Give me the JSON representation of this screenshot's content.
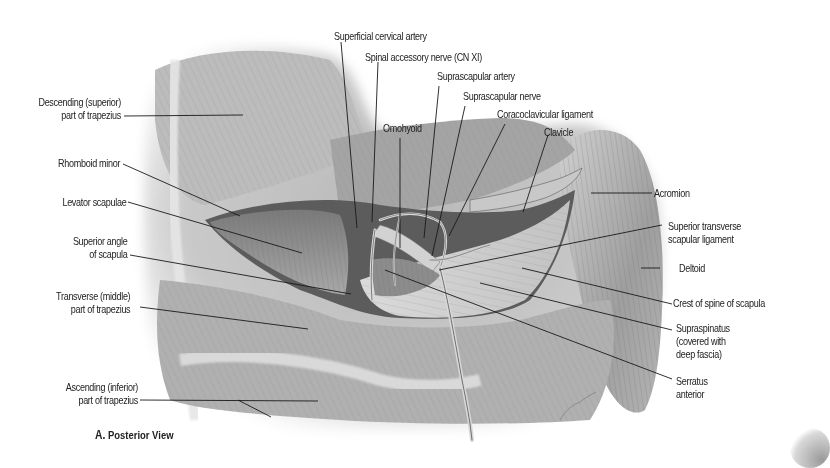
{
  "figure": {
    "caption_letter": "A.",
    "caption_text": "Posterior View",
    "background_color": "#ffffff",
    "illustration_tone": "#9a9a9a"
  },
  "labels": {
    "left": [
      {
        "id": "descending-trapezius",
        "lines": [
          "Descending (superior)",
          "part of trapezius"
        ]
      },
      {
        "id": "rhomboid-minor",
        "lines": [
          "Rhomboid minor"
        ]
      },
      {
        "id": "levator-scapulae",
        "lines": [
          "Levator scapulae"
        ]
      },
      {
        "id": "superior-angle-scapula",
        "lines": [
          "Superior angle",
          "of scapula"
        ]
      },
      {
        "id": "transverse-trapezius",
        "lines": [
          "Transverse (middle)",
          "part of trapezius"
        ]
      },
      {
        "id": "ascending-trapezius",
        "lines": [
          "Ascending (inferior)",
          "part of trapezius"
        ]
      }
    ],
    "top": [
      {
        "id": "superficial-cervical-artery",
        "lines": [
          "Superficial cervical artery"
        ]
      },
      {
        "id": "spinal-accessory-nerve",
        "lines": [
          "Spinal accessory nerve (CN XI)"
        ]
      },
      {
        "id": "suprascapular-artery",
        "lines": [
          "Suprascapular artery"
        ]
      },
      {
        "id": "suprascapular-nerve",
        "lines": [
          "Suprascapular nerve"
        ]
      },
      {
        "id": "omohyoid",
        "lines": [
          "Omohyoid"
        ]
      },
      {
        "id": "coracoclavicular-ligament",
        "lines": [
          "Coracoclavicular ligament"
        ]
      },
      {
        "id": "clavicle",
        "lines": [
          "Clavicle"
        ]
      }
    ],
    "right": [
      {
        "id": "acromion",
        "lines": [
          "Acromion"
        ]
      },
      {
        "id": "superior-transverse-scapular-ligament",
        "lines": [
          "Superior transverse",
          "scapular ligament"
        ]
      },
      {
        "id": "deltoid",
        "lines": [
          "Deltoid"
        ]
      },
      {
        "id": "crest-spine-scapula",
        "lines": [
          "Crest of spine of scapula"
        ]
      },
      {
        "id": "supraspinatus",
        "lines": [
          "Supraspinatus",
          "(covered with",
          "deep fascia)"
        ]
      },
      {
        "id": "serratus-anterior",
        "lines": [
          "Serratus",
          "anterior"
        ]
      }
    ]
  }
}
